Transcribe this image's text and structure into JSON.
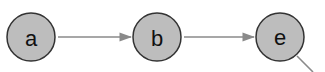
{
  "diagram": {
    "type": "directed-graph",
    "nodes": [
      {
        "id": "a",
        "label": "a",
        "cx": 31,
        "cy": 37,
        "r": 24
      },
      {
        "id": "b",
        "label": "b",
        "cx": 157,
        "cy": 37,
        "r": 24
      },
      {
        "id": "e",
        "label": "e",
        "cx": 280,
        "cy": 37,
        "r": 24
      }
    ],
    "edges": [
      {
        "from": "a",
        "to": "b"
      },
      {
        "from": "b",
        "to": "e"
      },
      {
        "from": "e",
        "to": "offscreen-lower-right"
      }
    ],
    "colors": {
      "node_fill": "#bdbdbd",
      "node_stroke": "#333333",
      "edge": "#8a8a8a"
    }
  }
}
